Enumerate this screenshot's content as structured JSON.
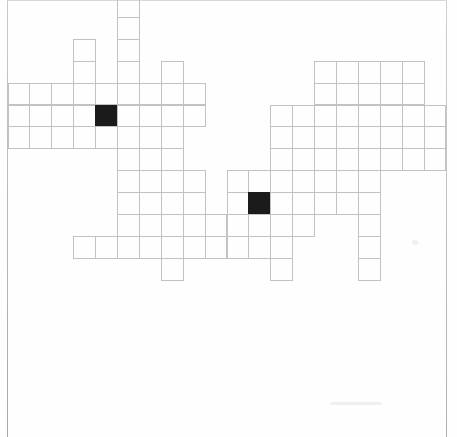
{
  "document": {
    "type": "crossword-grid",
    "title": "Blank crossword puzzle grid",
    "background_color": "#ffffff",
    "line_color": "#c2c2c2",
    "block_color": "#1b1b1b"
  },
  "grid": {
    "cell_size": 21.9,
    "origin_x": 7.5,
    "origin_y": -5.0,
    "columns": 20,
    "rows": 14,
    "black_cells": [
      {
        "row": 5,
        "col": 4
      },
      {
        "row": 9,
        "col": 11
      }
    ],
    "rows_data": [
      {
        "row": 0,
        "runs": [
          [
            5,
            5
          ]
        ]
      },
      {
        "row": 1,
        "runs": [
          [
            5,
            5
          ]
        ]
      },
      {
        "row": 2,
        "runs": [
          [
            3,
            3
          ],
          [
            5,
            5
          ]
        ]
      },
      {
        "row": 3,
        "runs": [
          [
            3,
            3
          ],
          [
            5,
            5
          ],
          [
            7,
            7
          ],
          [
            14,
            18
          ]
        ]
      },
      {
        "row": 4,
        "runs": [
          [
            0,
            8
          ],
          [
            14,
            18
          ]
        ]
      },
      {
        "row": 5,
        "runs": [
          [
            0,
            8
          ],
          [
            12,
            19
          ]
        ]
      },
      {
        "row": 6,
        "runs": [
          [
            0,
            7
          ],
          [
            12,
            19
          ]
        ]
      },
      {
        "row": 7,
        "runs": [
          [
            5,
            5
          ],
          [
            7,
            7
          ],
          [
            12,
            19
          ]
        ]
      },
      {
        "row": 8,
        "runs": [
          [
            5,
            8
          ],
          [
            7,
            7
          ],
          [
            10,
            16
          ]
        ]
      },
      {
        "row": 9,
        "runs": [
          [
            5,
            8
          ],
          [
            10,
            16
          ]
        ]
      },
      {
        "row": 10,
        "runs": [
          [
            5,
            9
          ],
          [
            10,
            13
          ],
          [
            16,
            16
          ]
        ]
      },
      {
        "row": 11,
        "runs": [
          [
            3,
            12
          ],
          [
            16,
            16
          ]
        ]
      },
      {
        "row": 12,
        "runs": [
          [
            7,
            7
          ],
          [
            12,
            12
          ],
          [
            16,
            16
          ]
        ]
      }
    ]
  },
  "artifacts": {
    "smudges": [
      {
        "x": 412,
        "y": 240,
        "w": 6,
        "h": 5
      },
      {
        "x": 330,
        "y": 402,
        "w": 52,
        "h": 3
      }
    ]
  }
}
